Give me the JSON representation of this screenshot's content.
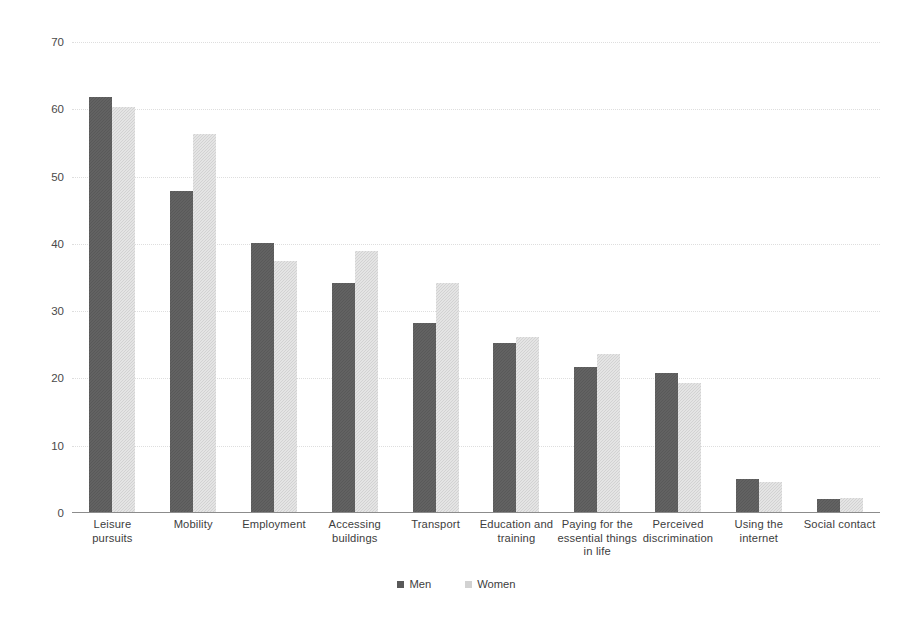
{
  "chart_data": {
    "type": "bar",
    "title": "",
    "subtitle": "",
    "xlabel": "",
    "ylabel": "",
    "ylim": [
      0,
      70
    ],
    "ytick_step": 10,
    "yticks": [
      "0",
      "10",
      "20",
      "30",
      "40",
      "50",
      "60",
      "70"
    ],
    "grid": true,
    "grid_style": "horizontal-dotted",
    "legend_position": "bottom-center",
    "categories": [
      "Leisure pursuits",
      "Mobility",
      "Employment",
      "Accessing buildings",
      "Transport",
      "Education and training",
      "Paying for the essential things in life",
      "Perceived discrimination",
      "Using the internet",
      "Social contact"
    ],
    "category_label_lines": [
      [
        "Leisure pursuits"
      ],
      [
        "Mobility"
      ],
      [
        "Employment"
      ],
      [
        "Accessing",
        "buildings"
      ],
      [
        "Transport"
      ],
      [
        "Education and",
        "training"
      ],
      [
        "Paying for the",
        "essential things",
        "in life"
      ],
      [
        "Perceived",
        "discrimination"
      ],
      [
        "Using the",
        "internet"
      ],
      [
        "Social contact"
      ]
    ],
    "series": [
      {
        "name": "Men",
        "color": "#595959",
        "values": [
          61.8,
          47.9,
          40.2,
          34.2,
          28.3,
          25.3,
          21.7,
          20.8,
          5.0,
          2.1
        ]
      },
      {
        "name": "Women",
        "color": "#d2d2d2",
        "values": [
          60.4,
          56.3,
          37.5,
          39.0,
          34.2,
          26.1,
          23.6,
          19.3,
          4.6,
          2.2
        ]
      }
    ]
  },
  "legend": {
    "items": [
      {
        "label": "Men",
        "marker": "legend-swatch-men"
      },
      {
        "label": "Women",
        "marker": "legend-swatch-women"
      }
    ]
  },
  "colors": {
    "men": "#595959",
    "women": "#d2d2d2",
    "axis": "#8c8c8c",
    "gridline": "#dedede",
    "text": "#3d3d3d",
    "background": "#ffffff"
  }
}
